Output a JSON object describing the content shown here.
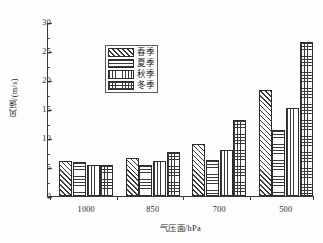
{
  "chart_data": {
    "type": "bar",
    "title": "",
    "subtitle": "",
    "xlabel": "气压面/hPa",
    "ylabel": "风速/(m/s)",
    "categories": [
      "1000",
      "850",
      "700",
      "500"
    ],
    "series": [
      {
        "name": "春季",
        "pattern": "diagonal-hatch",
        "values": [
          6.1,
          6.5,
          9.0,
          18.2
        ]
      },
      {
        "name": "夏季",
        "pattern": "horizontal-lines",
        "values": [
          5.8,
          5.3,
          6.2,
          11.4
        ]
      },
      {
        "name": "秋季",
        "pattern": "vertical-lines",
        "values": [
          5.4,
          6.0,
          8.0,
          15.2
        ]
      },
      {
        "name": "冬季",
        "pattern": "cross-grid",
        "values": [
          5.4,
          7.6,
          13.1,
          26.6
        ]
      }
    ],
    "ylim": [
      0,
      30
    ],
    "yticks": [
      0,
      5,
      10,
      15,
      20,
      25,
      30
    ],
    "ytick_labels": [
      "0",
      "5",
      "10",
      "15",
      "20",
      "25",
      "30"
    ],
    "y_minor_ticks": [
      2.5,
      7.5,
      12.5,
      17.5,
      22.5,
      27.5
    ],
    "grid": false,
    "legend_position": "upper-left",
    "axis_color": "#3a3a3a",
    "bar_edge_color": "#2d2d2d",
    "pattern_color": "#3a3a3a",
    "background_color": "#ffffff"
  },
  "legend": {
    "entries": [
      {
        "label": "春季"
      },
      {
        "label": "夏季"
      },
      {
        "label": "秋季"
      },
      {
        "label": "冬季"
      }
    ]
  }
}
